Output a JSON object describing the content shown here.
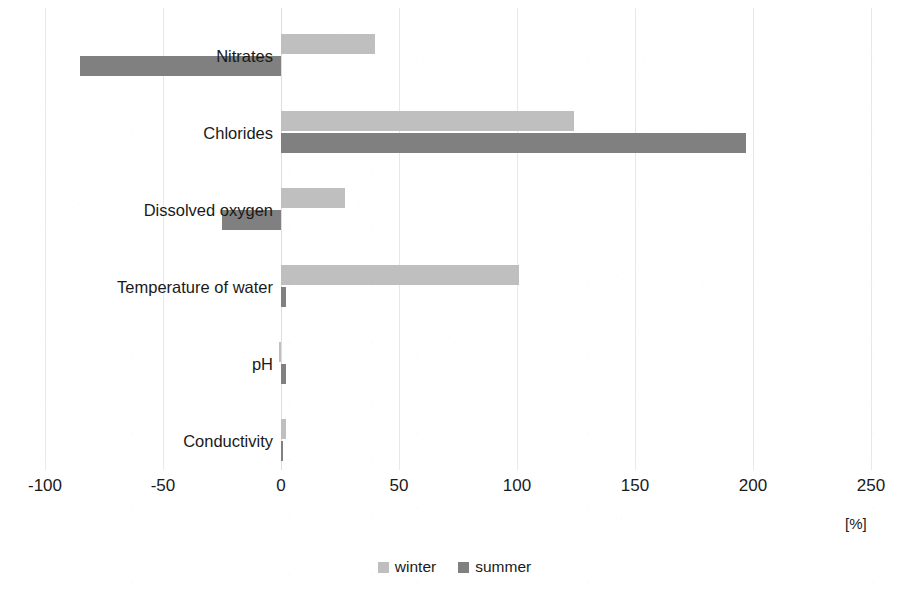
{
  "chart_data": {
    "type": "bar",
    "orientation": "horizontal",
    "title": "",
    "subtitle": "",
    "xlabel": "[%]",
    "ylabel": "",
    "xlim": [
      -100,
      250
    ],
    "xticks": [
      -100,
      -50,
      0,
      50,
      100,
      150,
      200,
      250
    ],
    "xtick_labels": [
      "-100",
      "-50",
      "0",
      "50",
      "100",
      "150",
      "200",
      "250"
    ],
    "unit": "[%]",
    "grid": true,
    "grid_axis": "x",
    "legend": [
      "winter",
      "summer"
    ],
    "legend_position": "bottom-center",
    "categories": [
      "Nitrates",
      "Chlorides",
      "Dissolved oxygen",
      "Temperature of water",
      "pH",
      "Conductivity"
    ],
    "series": [
      {
        "name": "winter",
        "color": "#bfbfbf",
        "values": [
          40,
          124,
          27,
          101,
          -1,
          2
        ]
      },
      {
        "name": "summer",
        "color": "#808080",
        "values": [
          -85,
          197,
          -25,
          2,
          2,
          0.5
        ]
      }
    ]
  },
  "axis": {
    "unit_label": "[%]"
  },
  "legend": {
    "items": [
      {
        "label": "winter",
        "color": "#bfbfbf"
      },
      {
        "label": "summer",
        "color": "#808080"
      }
    ]
  },
  "colors": {
    "winter": "#bfbfbf",
    "summer": "#808080",
    "gridline": "#e8e8e8",
    "text": "#1a1a1a",
    "background": "#ffffff"
  }
}
